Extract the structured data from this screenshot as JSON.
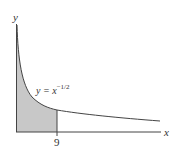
{
  "diagram": {
    "function_label": {
      "base": "y = x",
      "exponent": "−1/2"
    },
    "x_axis_label": "x",
    "y_axis_label": "y",
    "tick_label": "9",
    "shaded_region": "area under y = x^(-1/2) from 0 to 9",
    "colors": {
      "fill": "#c8c8c8",
      "stroke": "#444444"
    }
  }
}
